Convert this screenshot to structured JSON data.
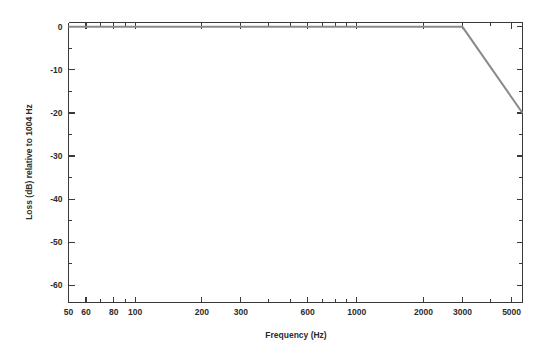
{
  "chart_data": {
    "type": "line",
    "title": "",
    "subtitle": "",
    "xlabel": "Frequency (Hz)",
    "ylabel": "Loss (dB) relative to 1004 Hz",
    "xscale": "log",
    "yscale": "linear",
    "xlim": [
      50,
      5600
    ],
    "ylim": [
      -64,
      1
    ],
    "grid": false,
    "legend": null,
    "x_tick_labels": [
      "50",
      "60",
      "80",
      "100",
      "200",
      "300",
      "600",
      "1000",
      "2000",
      "3000",
      "5000"
    ],
    "x_tick_values": [
      50,
      60,
      80,
      100,
      200,
      300,
      600,
      1000,
      2000,
      3000,
      5000
    ],
    "x_minor_ticks": [
      70,
      90,
      400,
      500,
      700,
      800,
      900,
      4000
    ],
    "y_tick_labels": [
      "0",
      "-10",
      "-20",
      "-30",
      "-40",
      "-50",
      "-60"
    ],
    "y_tick_values": [
      0,
      -10,
      -20,
      -30,
      -40,
      -50,
      -60
    ],
    "y_minor_ticks": [
      -5,
      -15,
      -25,
      -35,
      -45,
      -55
    ],
    "series": [
      {
        "name": "Loss mask",
        "color": "#8a8a8a",
        "points": [
          {
            "x": 50,
            "y": 0
          },
          {
            "x": 3000,
            "y": 0
          },
          {
            "x": 5600,
            "y": -20
          }
        ]
      }
    ]
  },
  "figure": {
    "background_color": "#ffffff",
    "axis_color": "#3a3a3a",
    "text_color": "#2b2b2b"
  }
}
